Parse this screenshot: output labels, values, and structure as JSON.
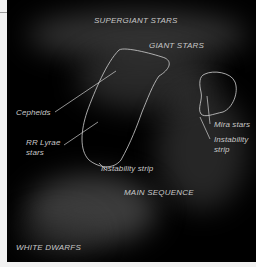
{
  "diagram": {
    "regions": {
      "supergiant": "SUPERGIANT STARS",
      "giant": "GIANT STARS",
      "main_sequence": "MAIN SEQUENCE",
      "white_dwarfs": "WHITE DWARFS"
    },
    "annotations": {
      "cepheids": "Cepheids",
      "rr_lyrae_line1": "RR Lyrae",
      "rr_lyrae_line2": "stars",
      "instability_strip_left": "Instability strip",
      "mira": "Mira stars",
      "instability_strip_right_line1": "Instability",
      "instability_strip_right_line2": "strip"
    },
    "colors": {
      "background": "#000000",
      "label": "#c8c8c8",
      "outline": "#d0d0d0",
      "frame": "#f2f2f2"
    }
  }
}
